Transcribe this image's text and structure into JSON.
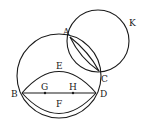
{
  "diagram": {
    "type": "geometric-figure",
    "labels": {
      "A": "A",
      "B": "B",
      "C": "C",
      "D": "D",
      "E": "E",
      "F": "F",
      "G": "G",
      "H": "H",
      "K": "K"
    },
    "elements": [
      {
        "kind": "circle",
        "name": "large circle through A, B, C, D"
      },
      {
        "kind": "circle",
        "name": "circle K through A and C"
      },
      {
        "kind": "segment",
        "name": "line BD",
        "points": [
          "G",
          "H"
        ]
      },
      {
        "kind": "arc",
        "name": "upper arc BED"
      },
      {
        "kind": "arc",
        "name": "lower arc BFD"
      },
      {
        "kind": "arc",
        "name": "lens arcs AC"
      }
    ]
  }
}
